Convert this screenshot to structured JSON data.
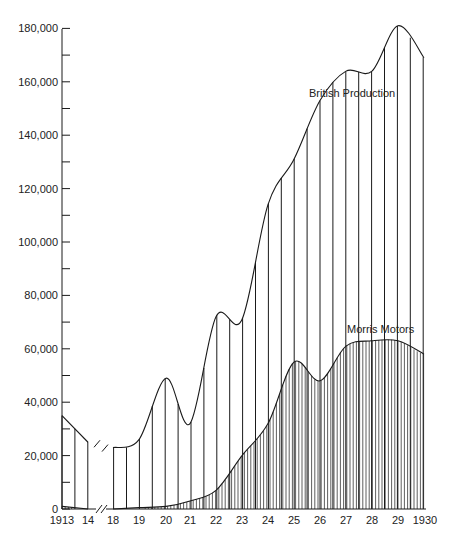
{
  "chart_data": {
    "type": "area",
    "title": "",
    "xlabel": "",
    "ylabel": "",
    "ylim": [
      0,
      180000
    ],
    "x_break_between": [
      "14",
      "18"
    ],
    "categories": [
      "1913",
      "14",
      "18",
      "19",
      "20",
      "21",
      "22",
      "23",
      "24",
      "25",
      "26",
      "27",
      "28",
      "29",
      "1930"
    ],
    "years": [
      1913,
      1914,
      1918,
      1919,
      1920,
      1921,
      1922,
      1923,
      1924,
      1925,
      1926,
      1927,
      1928,
      1929,
      1930
    ],
    "y_ticks": [
      "0",
      "20,000",
      "40,000",
      "60,000",
      "80,000",
      "100,000",
      "120,000",
      "140,000",
      "160,000",
      "180,000"
    ],
    "y_tick_values": [
      0,
      20000,
      40000,
      60000,
      80000,
      100000,
      120000,
      140000,
      160000,
      180000
    ],
    "series": [
      {
        "name": "British Production",
        "values": [
          35000,
          25000,
          23000,
          26000,
          49000,
          32000,
          72000,
          71000,
          114000,
          131000,
          153000,
          164000,
          164000,
          181000,
          169000
        ],
        "fill": "sparse-vertical-hatch"
      },
      {
        "name": "Morris Motors",
        "values": [
          1000,
          0,
          0,
          500,
          1000,
          3000,
          7000,
          20000,
          32000,
          55000,
          48000,
          61000,
          63000,
          63000,
          58000
        ],
        "fill": "dense-vertical-hatch"
      }
    ],
    "annotations": [
      {
        "text": "British Production",
        "series": "British Production"
      },
      {
        "text": "Morris Motors",
        "series": "Morris Motors"
      }
    ],
    "grid": false,
    "legend": "inline labels"
  },
  "labels": {
    "british": "British Production",
    "morris": "Morris Motors"
  },
  "colors": {
    "ink": "#1a1a1a",
    "background": "#ffffff"
  }
}
